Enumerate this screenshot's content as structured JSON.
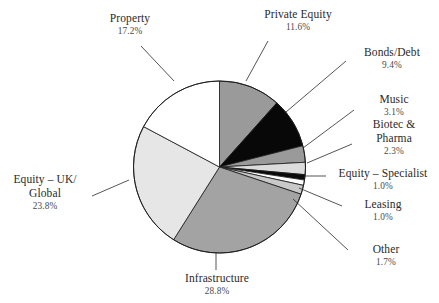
{
  "chart_data": {
    "type": "pie",
    "title": "",
    "subtitle": "",
    "xlabel": "",
    "ylabel": "",
    "legend_position": "none",
    "grid": false,
    "labels_show_percent": true,
    "start_angle_deg": 0,
    "direction": "clockwise",
    "categories": [
      "Private Equity",
      "Bonds/Debt",
      "Music",
      "Biotec & Pharma",
      "Equity – Specialist",
      "Leasing",
      "Other",
      "Infrastructure",
      "Equity – UK/ Global",
      "Property"
    ],
    "values": [
      11.6,
      9.4,
      3.1,
      2.3,
      1.0,
      1.0,
      1.7,
      28.8,
      23.8,
      17.2
    ],
    "value_labels": [
      "11.6%",
      "9.4%",
      "3.1%",
      "2.3%",
      "1.0%",
      "1.0%",
      "1.7%",
      "28.8%",
      "23.8%",
      "17.2%"
    ],
    "unit": "%",
    "total": 99.9,
    "slice_colors": [
      "#9a9a9a",
      "#080808",
      "#9a9a9a",
      "#dcdcdc",
      "#0a0a0a",
      "#ffffff",
      "#c9c9c9",
      "#a3a3a3",
      "#e6e6e6",
      "#ffffff"
    ],
    "slices": [
      {
        "label": "Private Equity",
        "value": 11.6,
        "value_label": "11.6%",
        "color": "#9a9a9a"
      },
      {
        "label": "Bonds/Debt",
        "value": 9.4,
        "value_label": "9.4%",
        "color": "#080808"
      },
      {
        "label": "Music",
        "value": 3.1,
        "value_label": "3.1%",
        "color": "#9a9a9a"
      },
      {
        "label": "Biotec & Pharma",
        "value": 2.3,
        "value_label": "2.3%",
        "color": "#dcdcdc"
      },
      {
        "label": "Equity – Specialist",
        "value": 1.0,
        "value_label": "1.0%",
        "color": "#0a0a0a"
      },
      {
        "label": "Leasing",
        "value": 1.0,
        "value_label": "1.0%",
        "color": "#ffffff"
      },
      {
        "label": "Other",
        "value": 1.7,
        "value_label": "1.7%",
        "color": "#c9c9c9"
      },
      {
        "label": "Infrastructure",
        "value": 28.8,
        "value_label": "28.8%",
        "color": "#a3a3a3"
      },
      {
        "label": "Equity – UK/ Global",
        "value": 23.8,
        "value_label": "23.8%",
        "color": "#e6e6e6"
      },
      {
        "label": "Property",
        "value": 17.2,
        "value_label": "17.2%",
        "color": "#ffffff"
      }
    ]
  },
  "labels": {
    "property": {
      "name": "Property",
      "pct": "17.2%"
    },
    "private_equity": {
      "name": "Private Equity",
      "pct": "11.6%"
    },
    "bonds_debt": {
      "name": "Bonds/Debt",
      "pct": "9.4%"
    },
    "music": {
      "name": "Music",
      "pct": "3.1%"
    },
    "biotec_pharma": {
      "name": "Biotec &\nPharma",
      "pct": "2.3%"
    },
    "equity_spec": {
      "name": "Equity – Specialist",
      "pct": "1.0%"
    },
    "leasing": {
      "name": "Leasing",
      "pct": "1.0%"
    },
    "other": {
      "name": "Other",
      "pct": "1.7%"
    },
    "equity_uk": {
      "name": "Equity – UK/\nGlobal",
      "pct": "23.8%"
    },
    "infrastructure": {
      "name": "Infrastructure",
      "pct": "28.8%"
    }
  },
  "style": {
    "outline_color": "#1a1a1a",
    "leader_color": "#2a2a2a",
    "background": "#ffffff"
  }
}
